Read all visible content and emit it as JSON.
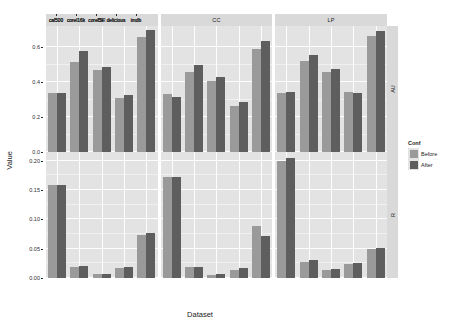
{
  "chart_data": {
    "type": "bar",
    "title": "",
    "xlabel": "Dataset",
    "ylabel": "Value",
    "grid": true,
    "legend_position": "right",
    "legend_title": "Conf",
    "legend_entries": [
      "Before",
      "After"
    ],
    "col_facets": [
      "BR",
      "CC",
      "LP"
    ],
    "row_facets": [
      "AU",
      "R"
    ],
    "categories": [
      "cal500",
      "corel16k",
      "corel5k",
      "delicious",
      "imdb"
    ],
    "panels": [
      {
        "row_facet": "AU",
        "col_facet": "BR",
        "ylim": [
          0.0,
          0.72
        ],
        "yticks": [
          "0.0",
          "0.2",
          "0.4",
          "0.6"
        ],
        "ytick_values": [
          0.0,
          0.2,
          0.4,
          0.6
        ],
        "series": [
          {
            "name": "Before",
            "values": [
              0.335,
              0.515,
              0.47,
              0.31,
              0.655
            ]
          },
          {
            "name": "After",
            "values": [
              0.337,
              0.575,
              0.487,
              0.325,
              0.7
            ]
          }
        ]
      },
      {
        "row_facet": "AU",
        "col_facet": "CC",
        "ylim": [
          0.0,
          0.72
        ],
        "yticks": [
          "0.0",
          "0.2",
          "0.4",
          "0.6"
        ],
        "ytick_values": [
          0.0,
          0.2,
          0.4,
          0.6
        ],
        "series": [
          {
            "name": "Before",
            "values": [
              0.33,
              0.455,
              0.405,
              0.265,
              0.59
            ]
          },
          {
            "name": "After",
            "values": [
              0.315,
              0.495,
              0.43,
              0.285,
              0.635
            ]
          }
        ]
      },
      {
        "row_facet": "AU",
        "col_facet": "LP",
        "ylim": [
          0.0,
          0.72
        ],
        "yticks": [
          "0.0",
          "0.2",
          "0.4",
          "0.6"
        ],
        "ytick_values": [
          0.0,
          0.2,
          0.4,
          0.6
        ],
        "series": [
          {
            "name": "Before",
            "values": [
              0.34,
              0.52,
              0.46,
              0.345,
              0.665
            ]
          },
          {
            "name": "After",
            "values": [
              0.345,
              0.555,
              0.475,
              0.34,
              0.69
            ]
          }
        ]
      },
      {
        "row_facet": "R",
        "col_facet": "BR",
        "ylim": [
          0.0,
          0.215
        ],
        "yticks": [
          "0.00",
          "0.05",
          "0.10",
          "0.15",
          "0.20"
        ],
        "ytick_values": [
          0.0,
          0.05,
          0.1,
          0.15,
          0.2
        ],
        "series": [
          {
            "name": "Before",
            "values": [
              0.158,
              0.019,
              0.006,
              0.017,
              0.073
            ]
          },
          {
            "name": "After",
            "values": [
              0.159,
              0.02,
              0.006,
              0.018,
              0.076
            ]
          }
        ]
      },
      {
        "row_facet": "R",
        "col_facet": "CC",
        "ylim": [
          0.0,
          0.215
        ],
        "yticks": [
          "0.00",
          "0.05",
          "0.10",
          "0.15",
          "0.20"
        ],
        "ytick_values": [
          0.0,
          0.05,
          0.1,
          0.15,
          0.2
        ],
        "series": [
          {
            "name": "Before",
            "values": [
              0.172,
              0.018,
              0.005,
              0.013,
              0.088
            ]
          },
          {
            "name": "After",
            "values": [
              0.173,
              0.019,
              0.006,
              0.017,
              0.072
            ]
          }
        ]
      },
      {
        "row_facet": "R",
        "col_facet": "LP",
        "ylim": [
          0.0,
          0.215
        ],
        "yticks": [
          "0.00",
          "0.05",
          "0.10",
          "0.15",
          "0.20"
        ],
        "ytick_values": [
          0.0,
          0.05,
          0.1,
          0.15,
          0.2
        ],
        "series": [
          {
            "name": "Before",
            "values": [
              0.199,
              0.027,
              0.013,
              0.024,
              0.05
            ]
          },
          {
            "name": "After",
            "values": [
              0.205,
              0.03,
              0.015,
              0.025,
              0.052
            ]
          }
        ]
      }
    ],
    "colors": {
      "before": "#9a9a9a",
      "after": "#5e5e5e",
      "panel_bg": "#e3e3e3",
      "strip_bg": "#d9d9d9",
      "grid_line": "#ffffff"
    }
  },
  "axes": {
    "x_title": "Dataset",
    "y_title": "Value"
  },
  "legend": {
    "title": "Conf",
    "items": [
      {
        "label": "Before",
        "color": "#9a9a9a"
      },
      {
        "label": "After",
        "color": "#5e5e5e"
      }
    ]
  }
}
